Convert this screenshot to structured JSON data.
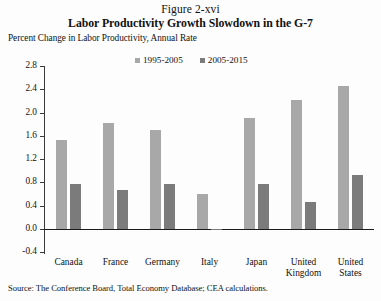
{
  "figure": {
    "number": "Figure 2-xvi",
    "title": "Labor Productivity Growth Slowdown in the G-7",
    "axis_note": "Percent Change in Labor Productivity, Annual Rate",
    "source": "Source: The Conference Board, Total Economy Database; CEA calculations."
  },
  "colors": {
    "series1": "#a8a8a8",
    "series2": "#7b7b7b",
    "axis": "#1a1a1a",
    "background": "#fdfdfd"
  },
  "chart_data": {
    "type": "bar",
    "title": "Labor Productivity Growth Slowdown in the G-7",
    "subtitle": "Figure 2-xvi",
    "xlabel": "",
    "ylabel": "Percent Change in Labor Productivity, Annual Rate",
    "ylim": [
      -0.4,
      2.8
    ],
    "yticks": [
      "2.8",
      "2.4",
      "2.0",
      "1.6",
      "1.2",
      "0.8",
      "0.4",
      "0.0",
      "-0.4"
    ],
    "ytick_values": [
      2.8,
      2.4,
      2.0,
      1.6,
      1.2,
      0.8,
      0.4,
      0.0,
      -0.4
    ],
    "grid": false,
    "legend_position": "top-center",
    "categories": [
      "Canada",
      "France",
      "Germany",
      "Italy",
      "Japan",
      "United Kingdom",
      "United States"
    ],
    "series": [
      {
        "name": "1995-2005",
        "color": "#a8a8a8",
        "values": [
          1.53,
          1.82,
          1.7,
          0.6,
          1.9,
          2.21,
          2.45
        ]
      },
      {
        "name": "2005-2015",
        "color": "#7b7b7b",
        "values": [
          0.78,
          0.67,
          0.77,
          -0.02,
          0.77,
          0.47,
          0.93
        ]
      }
    ]
  }
}
